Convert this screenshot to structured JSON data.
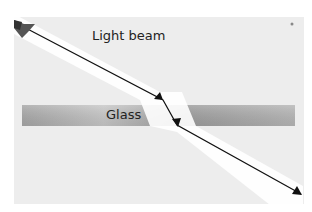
{
  "diagram": {
    "labels": {
      "beam": "Light beam",
      "glass": "Glass"
    },
    "colors": {
      "background": "#ededed",
      "glass_dark": "#9a9a9a",
      "glass_light": "#c8c8c8",
      "beam_glow": "#ffffff",
      "ray": "#111111"
    },
    "ray_points": [
      [
        14,
        22
      ],
      [
        163,
        100
      ],
      [
        177,
        125
      ],
      [
        301,
        194
      ]
    ]
  }
}
